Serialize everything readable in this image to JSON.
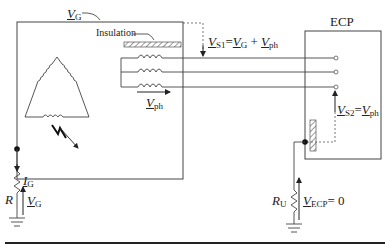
{
  "diagram": {
    "type": "electrical-schematic",
    "labels": {
      "vg": {
        "sym": "V",
        "sub": "G"
      },
      "insulation": "Insulation",
      "vs1": {
        "sym": "V",
        "sub": "S1",
        "eq": "=",
        "sym2": "V",
        "sub2": "G",
        "plus": "+",
        "sym3": "V",
        "sub3": "ph"
      },
      "vph": {
        "sym": "V",
        "sub": "ph"
      },
      "ecp": "ECP",
      "vs2": {
        "sym": "V",
        "sub": "S2",
        "eq": "=",
        "sym2": "V",
        "sub2": "ph"
      },
      "ig": {
        "sym": "I",
        "sub": "G"
      },
      "r": "R",
      "vg_bottom": {
        "sym": "V",
        "sub": "G"
      },
      "ru": {
        "sym": "R",
        "sub": "U"
      },
      "vecp": {
        "sym": "V",
        "sub": "ECP",
        "eq": "= 0"
      }
    },
    "components": [
      "generator-enclosure",
      "delta-winding",
      "three-phase-coils",
      "insulation-bar",
      "three-conductors",
      "ecp-enclosure",
      "ground-resistor-R",
      "ground-resistor-RU",
      "ground-symbols"
    ],
    "colors": {
      "line": "#333333",
      "hatch": "#555555"
    }
  }
}
